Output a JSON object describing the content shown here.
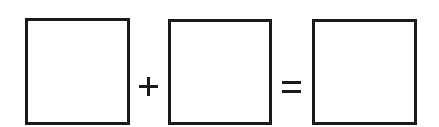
{
  "diagram": {
    "type": "equation-template",
    "boxes": [
      {
        "id": "box-1",
        "content": ""
      },
      {
        "id": "box-2",
        "content": ""
      },
      {
        "id": "box-3",
        "content": ""
      }
    ],
    "operators": [
      {
        "symbol": "+",
        "name": "plus"
      },
      {
        "symbol": "=",
        "name": "equals"
      }
    ],
    "colors": {
      "stroke": "#1a1a1a",
      "background": "#ffffff"
    }
  }
}
